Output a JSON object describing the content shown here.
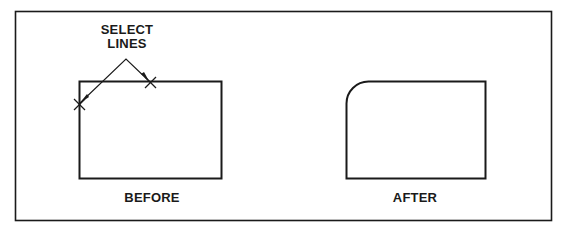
{
  "figure": {
    "type": "fillet-before-after",
    "stroke_color": "#1a1a1a",
    "background_color": "#ffffff"
  },
  "annotation": {
    "line1": "SELECT",
    "line2": "LINES",
    "markers": [
      "x-marker-left-edge",
      "x-marker-top-edge"
    ]
  },
  "panels": [
    {
      "id": "before",
      "label": "BEFORE",
      "shape": "rectangle-square-corners"
    },
    {
      "id": "after",
      "label": "AFTER",
      "shape": "rectangle-filleted-top-left-corner"
    }
  ]
}
